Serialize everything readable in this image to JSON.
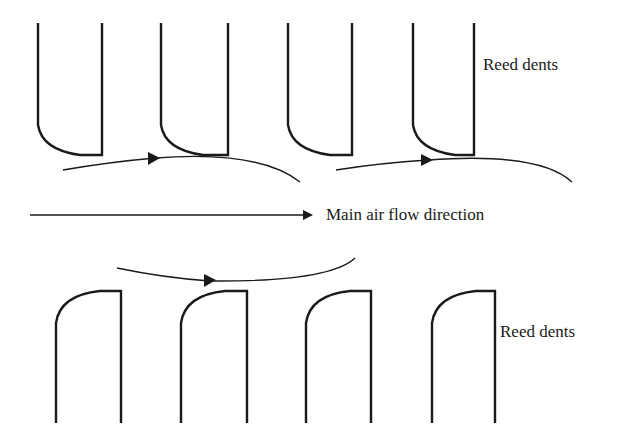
{
  "diagram": {
    "top_label": "Reed dents",
    "bottom_label": "Reed dents",
    "main_arrow_label": "Main air flow direction",
    "stroke_color": "#1a1a1a",
    "background": "#ffffff"
  }
}
